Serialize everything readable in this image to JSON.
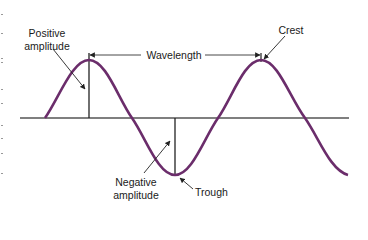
{
  "diagram": {
    "type": "transverse-wave",
    "labels": {
      "positive_amplitude_line1": "Positive",
      "positive_amplitude_line2": "amplitude",
      "wavelength": "Wavelength",
      "crest": "Crest",
      "negative_amplitude_line1": "Negative",
      "negative_amplitude_line2": "amplitude",
      "trough": "Trough"
    },
    "colors": {
      "wave": "#6b2d6b",
      "lines": "#222222",
      "baseline": "#444444",
      "text": "#1a1a1a"
    }
  }
}
